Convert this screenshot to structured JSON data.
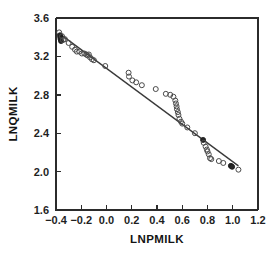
{
  "chart_data": {
    "type": "scatter",
    "title": "",
    "xlabel": "LNPMILK",
    "ylabel": "LNQMILK",
    "xlim": [
      -0.4,
      1.2
    ],
    "ylim": [
      1.6,
      3.6
    ],
    "xticks": [
      -0.4,
      -0.2,
      0.0,
      0.2,
      0.4,
      0.6,
      0.8,
      1.0,
      1.2
    ],
    "xtick_labels": [
      "-0.4",
      "-0.2",
      "0.0",
      "0.2",
      "0.4",
      "0.6",
      "0.8",
      "1.0",
      "1.2"
    ],
    "yticks": [
      1.6,
      2.0,
      2.4,
      2.8,
      3.2,
      3.6
    ],
    "ytick_labels": [
      "1.6",
      "2.0",
      "2.4",
      "2.8",
      "3.2",
      "3.6"
    ],
    "grid": false,
    "legend": null,
    "marker": "open-circle",
    "fit_line": {
      "type": "linear-regression",
      "x_start": -0.375,
      "y_start": 3.44,
      "x_end": 1.045,
      "y_end": 2.06,
      "slope": -0.972,
      "intercept": 3.076
    },
    "points": [
      {
        "x": -0.375,
        "y": 3.45,
        "filled": false
      },
      {
        "x": -0.368,
        "y": 3.42,
        "filled": true
      },
      {
        "x": -0.366,
        "y": 3.4,
        "filled": true
      },
      {
        "x": -0.364,
        "y": 3.38,
        "filled": true
      },
      {
        "x": -0.36,
        "y": 3.36,
        "filled": true
      },
      {
        "x": -0.352,
        "y": 3.41,
        "filled": false
      },
      {
        "x": -0.345,
        "y": 3.37,
        "filled": false
      },
      {
        "x": -0.33,
        "y": 3.38,
        "filled": false
      },
      {
        "x": -0.3,
        "y": 3.34,
        "filled": false
      },
      {
        "x": -0.272,
        "y": 3.3,
        "filled": false
      },
      {
        "x": -0.25,
        "y": 3.27,
        "filled": false
      },
      {
        "x": -0.235,
        "y": 3.25,
        "filled": false
      },
      {
        "x": -0.215,
        "y": 3.25,
        "filled": false
      },
      {
        "x": -0.195,
        "y": 3.23,
        "filled": false
      },
      {
        "x": -0.175,
        "y": 3.23,
        "filled": false
      },
      {
        "x": -0.16,
        "y": 3.22,
        "filled": false
      },
      {
        "x": -0.15,
        "y": 3.21,
        "filled": false
      },
      {
        "x": -0.14,
        "y": 3.22,
        "filled": false
      },
      {
        "x": -0.13,
        "y": 3.19,
        "filled": false
      },
      {
        "x": -0.115,
        "y": 3.17,
        "filled": false
      },
      {
        "x": -0.1,
        "y": 3.16,
        "filled": false
      },
      {
        "x": -0.01,
        "y": 3.1,
        "filled": false
      },
      {
        "x": 0.175,
        "y": 3.03,
        "filled": false
      },
      {
        "x": 0.178,
        "y": 2.99,
        "filled": false
      },
      {
        "x": 0.205,
        "y": 2.95,
        "filled": false
      },
      {
        "x": 0.235,
        "y": 2.93,
        "filled": false
      },
      {
        "x": 0.28,
        "y": 2.9,
        "filled": false
      },
      {
        "x": 0.39,
        "y": 2.86,
        "filled": false
      },
      {
        "x": 0.47,
        "y": 2.81,
        "filled": false
      },
      {
        "x": 0.505,
        "y": 2.8,
        "filled": false
      },
      {
        "x": 0.53,
        "y": 2.78,
        "filled": false
      },
      {
        "x": 0.545,
        "y": 2.74,
        "filled": false
      },
      {
        "x": 0.55,
        "y": 2.71,
        "filled": false
      },
      {
        "x": 0.555,
        "y": 2.68,
        "filled": false
      },
      {
        "x": 0.558,
        "y": 2.65,
        "filled": false
      },
      {
        "x": 0.565,
        "y": 2.62,
        "filled": false
      },
      {
        "x": 0.57,
        "y": 2.59,
        "filled": false
      },
      {
        "x": 0.578,
        "y": 2.55,
        "filled": false
      },
      {
        "x": 0.59,
        "y": 2.52,
        "filled": false
      },
      {
        "x": 0.6,
        "y": 2.5,
        "filled": false
      },
      {
        "x": 0.64,
        "y": 2.46,
        "filled": false
      },
      {
        "x": 0.7,
        "y": 2.4,
        "filled": false
      },
      {
        "x": 0.765,
        "y": 2.33,
        "filled": true
      },
      {
        "x": 0.77,
        "y": 2.3,
        "filled": false
      },
      {
        "x": 0.785,
        "y": 2.26,
        "filled": false
      },
      {
        "x": 0.795,
        "y": 2.23,
        "filled": false
      },
      {
        "x": 0.8,
        "y": 2.21,
        "filled": false
      },
      {
        "x": 0.81,
        "y": 2.18,
        "filled": false
      },
      {
        "x": 0.82,
        "y": 2.14,
        "filled": false
      },
      {
        "x": 0.83,
        "y": 2.13,
        "filled": false
      },
      {
        "x": 0.89,
        "y": 2.11,
        "filled": false
      },
      {
        "x": 0.925,
        "y": 2.09,
        "filled": false
      },
      {
        "x": 0.985,
        "y": 2.06,
        "filled": true
      },
      {
        "x": 0.995,
        "y": 2.05,
        "filled": true
      },
      {
        "x": 1.045,
        "y": 2.02,
        "filled": false
      }
    ]
  },
  "axes": {
    "x_title": "LNPMILK",
    "y_title": "LNQMILK"
  }
}
